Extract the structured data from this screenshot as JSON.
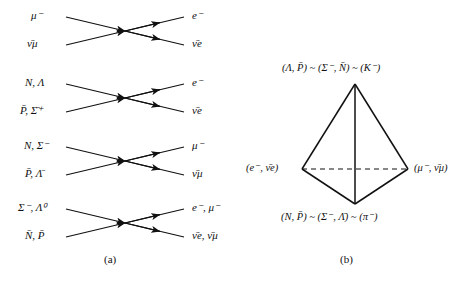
{
  "figure": {
    "background": "#ffffff",
    "ink": "#111111"
  },
  "panel_a": {
    "caption": "(a)",
    "diagrams": [
      {
        "index": 1,
        "top_left": "μ⁻",
        "bottom_left": "ν̄μ",
        "top_right": "e⁻",
        "bottom_right": "ν̄e"
      },
      {
        "index": 2,
        "top_left": "N, Λ",
        "bottom_left": "P̄, Σ̄⁺",
        "top_right": "e⁻",
        "bottom_right": "ν̄e"
      },
      {
        "index": 3,
        "top_left": "N, Σ⁻",
        "bottom_left": "P̄, Λ̄",
        "top_right": "μ⁻",
        "bottom_right": "ν̄μ"
      },
      {
        "index": 4,
        "top_left": "Σ⁻, Λ⁰",
        "bottom_left": "N̄, P̄",
        "top_right": "e⁻, μ⁻",
        "bottom_right": "ν̄e, ν̄μ"
      }
    ]
  },
  "panel_b": {
    "caption": "(b)",
    "shape": "tetrahedron",
    "hidden_edge_style": "dashed",
    "vertices": {
      "top": "(Λ, P̄) ~ (Σ⁻, N̄) ~ (K⁻)",
      "left": "(e⁻, ν̄e)",
      "right": "(μ⁻, ν̄μ)",
      "bottom": "(N, P̄) ~ (Σ⁻, Λ̄) ~ (π⁻)"
    }
  }
}
